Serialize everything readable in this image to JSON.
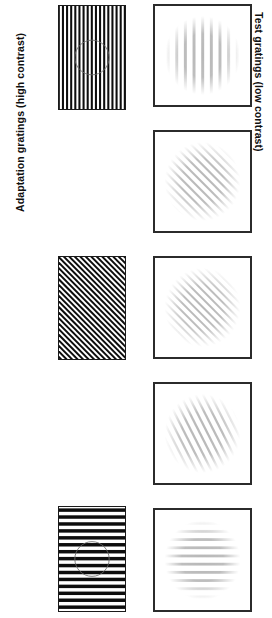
{
  "figure": {
    "background_color": "#ffffff",
    "width": 272,
    "height": 618,
    "ink_color": "#111111",
    "border_color": "#2b2b2b"
  },
  "labels": {
    "left_axis": "Adaptation gratings (high contrast)",
    "right_axis": "Test gratings (low contrast)"
  },
  "columns": [
    {
      "id": "adaptation",
      "name": "Adaptation gratings (high contrast)",
      "contrast": "high",
      "side": "left",
      "border": "thin"
    },
    {
      "id": "test",
      "name": "Test gratings (low contrast)",
      "contrast": "low",
      "side": "right",
      "border": "thick"
    }
  ],
  "panels": {
    "adaptation": [
      {
        "index": 1,
        "name": "adaptation-grating-vertical",
        "orientation": "vertical",
        "angle_deg": 0,
        "cycles": 16,
        "contrast": "high",
        "bar_color": "#0d0d0d",
        "gap_color": "#ffffff",
        "fixation_circle": true,
        "x": 58,
        "y": 5,
        "width": 68,
        "height": 105
      },
      {
        "index": 2,
        "name": "adaptation-grating-diagonal",
        "orientation": "diagonal",
        "angle_deg": 45,
        "cycles": 17,
        "contrast": "high",
        "bar_color": "#0d0d0d",
        "gap_color": "#ffffff",
        "fixation_circle": false,
        "x": 58,
        "y": 256,
        "width": 68,
        "height": 104
      },
      {
        "index": 3,
        "name": "adaptation-grating-horizontal",
        "orientation": "horizontal",
        "angle_deg": 90,
        "cycles": 15,
        "contrast": "high",
        "bar_color": "#0d0d0d",
        "gap_color": "#ffffff",
        "fixation_circle": true,
        "x": 58,
        "y": 506,
        "width": 68,
        "height": 106
      }
    ],
    "test": [
      {
        "index": 1,
        "name": "test-grating-vertical",
        "orientation": "vertical",
        "angle_deg": 0,
        "cycles": 9,
        "contrast": "low",
        "bar_color": "#8c8c8c",
        "x": 153,
        "y": 4,
        "width": 99,
        "height": 103
      },
      {
        "index": 2,
        "name": "test-grating-diagonal-steep",
        "orientation": "diagonal",
        "angle_deg": 45,
        "cycles": 14,
        "contrast": "low",
        "bar_color": "#8c8c8c",
        "x": 153,
        "y": 130,
        "width": 99,
        "height": 103
      },
      {
        "index": 3,
        "name": "test-grating-diagonal-mid",
        "orientation": "diagonal",
        "angle_deg": 45,
        "cycles": 15,
        "contrast": "low",
        "bar_color": "#8c8c8c",
        "x": 153,
        "y": 256,
        "width": 99,
        "height": 103
      },
      {
        "index": 4,
        "name": "test-grating-diagonal-shallow",
        "orientation": "diagonal",
        "angle_deg": 27,
        "cycles": 13,
        "contrast": "low",
        "bar_color": "#8c8c8c",
        "x": 153,
        "y": 382,
        "width": 99,
        "height": 103
      },
      {
        "index": 5,
        "name": "test-grating-horizontal",
        "orientation": "horizontal",
        "angle_deg": 90,
        "cycles": 10,
        "contrast": "low",
        "bar_color": "#8c8c8c",
        "x": 153,
        "y": 508,
        "width": 99,
        "height": 104
      }
    ]
  }
}
